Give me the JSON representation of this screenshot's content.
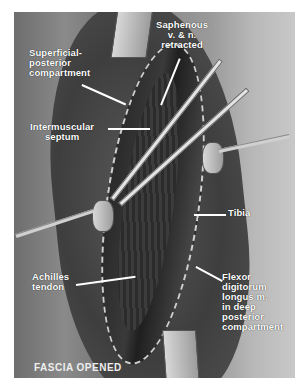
{
  "figure": {
    "caption": "FASCIA OPENED",
    "labels": {
      "superficial_posterior": [
        "Superficial-",
        "posterior",
        "compartment"
      ],
      "saphenous": [
        "Saphenous",
        "v. & n.",
        "retracted"
      ],
      "intermuscular_septum": [
        "Intermuscular",
        "septum"
      ],
      "tibia": [
        "Tibia"
      ],
      "achilles": [
        "Achilles",
        "tendon"
      ],
      "flexor": [
        "Flexor",
        "digitorum",
        "longus m.",
        "in deep",
        "posterior",
        "compartment"
      ]
    }
  }
}
